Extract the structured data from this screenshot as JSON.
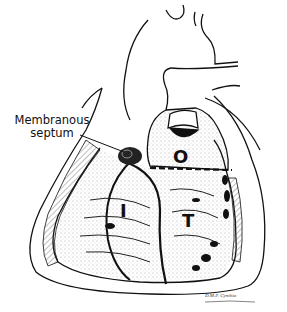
{
  "figure": {
    "labels": {
      "callout_line1": "Membranous",
      "callout_line2": "septum",
      "outlet": "O",
      "inlet": "I",
      "trabecular": "T"
    },
    "signature": "D.M.P. Cynthia"
  }
}
